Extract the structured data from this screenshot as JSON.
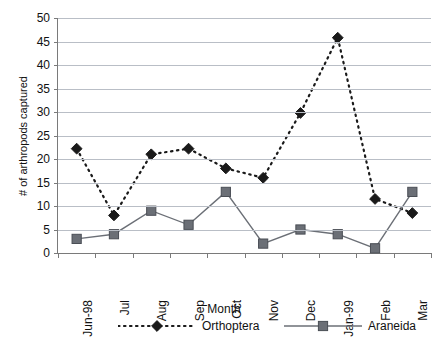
{
  "chart_data": {
    "type": "line",
    "title": "",
    "xlabel": "Month",
    "ylabel": "# of arthropods captured",
    "categories": [
      "Jun-98",
      "Jul",
      "Aug",
      "Sep",
      "Oct",
      "Nov",
      "Dec",
      "Jan-99",
      "Feb",
      "Mar"
    ],
    "ylim": [
      0,
      50
    ],
    "yticks": [
      0,
      5,
      10,
      15,
      20,
      25,
      30,
      35,
      40,
      45,
      50
    ],
    "ytick_labels": [
      "0",
      "5",
      "10",
      "15",
      "20",
      "25",
      "30",
      "35",
      "40",
      "45",
      "50"
    ],
    "grid": "horizontal",
    "legend_position": "bottom",
    "series": [
      {
        "name": "Orthoptera",
        "values": [
          22.2,
          8,
          21,
          22.2,
          18,
          16,
          29.8,
          45.8,
          11.5,
          8.5
        ],
        "color": "#1a1a1a",
        "line_style": "dashed",
        "marker": "diamond"
      },
      {
        "name": "Araneida",
        "values": [
          3,
          4,
          9,
          6,
          13,
          2,
          5,
          4,
          1,
          13
        ],
        "color": "#6b6f76",
        "line_style": "solid",
        "marker": "square"
      }
    ]
  },
  "axis": {
    "line_color": "#7a7a7a",
    "grid_color": "#b9bec6"
  }
}
